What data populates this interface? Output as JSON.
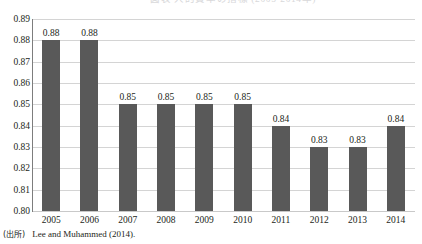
{
  "title": {
    "text": "図表 人的資本の指標 (2005-2014年)",
    "visible": "cropped"
  },
  "source": {
    "tag": "(出所)",
    "text": "Lee and Muhammed (2014)."
  },
  "chart_data": {
    "type": "bar",
    "title": "",
    "xlabel": "",
    "ylabel": "",
    "categories": [
      "2005",
      "2006",
      "2007",
      "2008",
      "2009",
      "2010",
      "2011",
      "2012",
      "2013",
      "2014"
    ],
    "values": [
      0.88,
      0.88,
      0.85,
      0.85,
      0.85,
      0.85,
      0.84,
      0.83,
      0.83,
      0.84
    ],
    "data_labels": [
      "0.88",
      "0.88",
      "0.85",
      "0.85",
      "0.85",
      "0.85",
      "0.84",
      "0.83",
      "0.83",
      "0.84"
    ],
    "ylim": [
      0.8,
      0.89
    ],
    "ytick_values": [
      0.89,
      0.88,
      0.87,
      0.86,
      0.85,
      0.84,
      0.83,
      0.82,
      0.81,
      0.8
    ],
    "ytick_labels": [
      "0.89",
      "0.88",
      "0.87",
      "0.86",
      "0.85",
      "0.84",
      "0.83",
      "0.82",
      "0.81",
      "0.80"
    ],
    "grid": true,
    "legend": false,
    "bar_color": "#595959",
    "grid_color": "#d4d4d4",
    "axis_color": "#7d7d7d"
  }
}
